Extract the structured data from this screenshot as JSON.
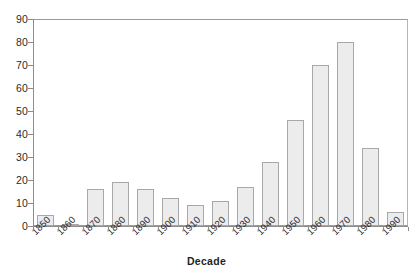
{
  "chart_data": {
    "type": "bar",
    "title": "",
    "xlabel": "Decade",
    "ylabel": "",
    "categories": [
      "1850",
      "1860",
      "1870",
      "1880",
      "1890",
      "1900",
      "1910",
      "1920",
      "1930",
      "1940",
      "1950",
      "1960",
      "1970",
      "1980",
      "1990"
    ],
    "values": [
      5,
      1,
      16,
      19,
      16,
      12,
      9,
      11,
      17,
      28,
      46,
      70,
      80,
      34,
      6
    ],
    "ylim": [
      0,
      90
    ],
    "y_ticks": [
      0,
      10,
      20,
      30,
      40,
      50,
      60,
      70,
      80,
      90
    ],
    "y_tick_labels": [
      "0",
      "10",
      "20",
      "30",
      "40",
      "50",
      "60",
      "70",
      "80",
      "90"
    ],
    "grid": false,
    "legend": false,
    "legend_position": "none",
    "bar_fill_color": "#ececec",
    "bar_border_color": "#a8a8a8",
    "axis_color": "#8c8c8c",
    "text_color": "#2b2b2b",
    "background_color": "#ffffff"
  },
  "axis": {
    "x_title": "Decade"
  }
}
